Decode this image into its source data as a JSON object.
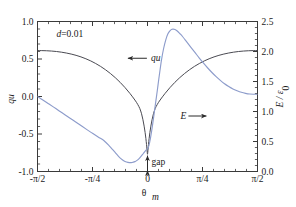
{
  "chart_data": {
    "type": "line",
    "title": "",
    "xlabel": "θ",
    "xlabel_sub": "m",
    "ylabel_left": "qu",
    "ylabel_right": "E / ε",
    "ylabel_right_sub": "0",
    "xlim": [
      -1.5707963,
      1.5707963
    ],
    "ylim_left": [
      -1.0,
      1.0
    ],
    "ylim_right": [
      0.0,
      2.5
    ],
    "grid": false,
    "legend_position": "inline-annotations",
    "xticklabels": [
      "-π/2",
      "-π/4",
      "0",
      "π/4",
      "π/2"
    ],
    "xtickvalues": [
      -1.5707963,
      -0.7853982,
      0,
      0.7853982,
      1.5707963
    ],
    "yticklabels_left": [
      "1.0",
      "0.5",
      "0.0",
      "-0.5",
      "-1.0"
    ],
    "ytickvalues_left": [
      1.0,
      0.5,
      0.0,
      -0.5,
      -1.0
    ],
    "yticklabels_right": [
      "2.5",
      "2.0",
      "1.5",
      "1.0",
      "0.5",
      "0.0"
    ],
    "ytickvalues_right": [
      2.5,
      2.0,
      1.5,
      1.0,
      0.5,
      0.0
    ],
    "minor_ticks_per_interval": 5,
    "annotations": [
      {
        "id": "param",
        "text": "d=0.01",
        "x": -1.3,
        "y_left": 0.8
      },
      {
        "id": "qu-label",
        "text": "qu",
        "arrow": "left",
        "x": 0.02,
        "y_left": 0.47
      },
      {
        "id": "E-label",
        "text": "E",
        "arrow": "right",
        "x": 0.47,
        "y_left": -0.3
      },
      {
        "id": "gap-label",
        "text": "gap",
        "arrow": "vertical-double",
        "x": 0.0,
        "y_left": -0.88
      }
    ],
    "series": [
      {
        "name": "qu",
        "axis": "left",
        "color": "#4a4a52",
        "points": [
          [
            -1.5708,
            0.612
          ],
          [
            -1.51,
            0.612
          ],
          [
            -1.44,
            0.61
          ],
          [
            -1.37,
            0.606
          ],
          [
            -1.3,
            0.6
          ],
          [
            -1.23,
            0.591
          ],
          [
            -1.16,
            0.58
          ],
          [
            -1.09,
            0.566
          ],
          [
            -1.02,
            0.549
          ],
          [
            -0.95,
            0.528
          ],
          [
            -0.88,
            0.503
          ],
          [
            -0.81,
            0.474
          ],
          [
            -0.74,
            0.44
          ],
          [
            -0.67,
            0.401
          ],
          [
            -0.6,
            0.357
          ],
          [
            -0.53,
            0.307
          ],
          [
            -0.46,
            0.251
          ],
          [
            -0.39,
            0.188
          ],
          [
            -0.32,
            0.118
          ],
          [
            -0.25,
            0.04
          ],
          [
            -0.18,
            -0.047
          ],
          [
            -0.14,
            -0.105
          ],
          [
            -0.11,
            -0.16
          ],
          [
            -0.085,
            -0.23
          ],
          [
            -0.065,
            -0.31
          ],
          [
            -0.048,
            -0.395
          ],
          [
            -0.034,
            -0.48
          ],
          [
            -0.023,
            -0.56
          ],
          [
            -0.014,
            -0.64
          ],
          [
            -0.008,
            -0.7
          ],
          [
            -0.0035,
            -0.745
          ],
          [
            0.0,
            -0.77
          ],
          [
            0.0035,
            -0.745
          ],
          [
            0.008,
            -0.7
          ],
          [
            0.014,
            -0.64
          ],
          [
            0.023,
            -0.56
          ],
          [
            0.034,
            -0.48
          ],
          [
            0.048,
            -0.395
          ],
          [
            0.065,
            -0.31
          ],
          [
            0.085,
            -0.23
          ],
          [
            0.11,
            -0.16
          ],
          [
            0.14,
            -0.105
          ],
          [
            0.18,
            -0.047
          ],
          [
            0.25,
            0.04
          ],
          [
            0.32,
            0.118
          ],
          [
            0.39,
            0.188
          ],
          [
            0.46,
            0.251
          ],
          [
            0.53,
            0.307
          ],
          [
            0.6,
            0.357
          ],
          [
            0.67,
            0.401
          ],
          [
            0.74,
            0.44
          ],
          [
            0.81,
            0.474
          ],
          [
            0.88,
            0.503
          ],
          [
            0.95,
            0.528
          ],
          [
            1.02,
            0.549
          ],
          [
            1.09,
            0.566
          ],
          [
            1.16,
            0.58
          ],
          [
            1.23,
            0.591
          ],
          [
            1.3,
            0.6
          ],
          [
            1.37,
            0.606
          ],
          [
            1.44,
            0.61
          ],
          [
            1.51,
            0.612
          ],
          [
            1.5708,
            0.612
          ]
        ]
      },
      {
        "name": "E",
        "axis": "right",
        "color": "#8d9ccb",
        "points": [
          [
            -1.5708,
            1.25
          ],
          [
            -1.5,
            1.196
          ],
          [
            -1.42,
            1.135
          ],
          [
            -1.34,
            1.073
          ],
          [
            -1.26,
            1.01
          ],
          [
            -1.18,
            0.947
          ],
          [
            -1.1,
            0.884
          ],
          [
            -1.02,
            0.821
          ],
          [
            -0.94,
            0.757
          ],
          [
            -0.86,
            0.694
          ],
          [
            -0.78,
            0.632
          ],
          [
            -0.7,
            0.572
          ],
          [
            -0.62,
            0.513
          ],
          [
            -0.54,
            0.42
          ],
          [
            -0.5,
            0.368
          ],
          [
            -0.46,
            0.315
          ],
          [
            -0.42,
            0.262
          ],
          [
            -0.38,
            0.215
          ],
          [
            -0.34,
            0.18
          ],
          [
            -0.3,
            0.158
          ],
          [
            -0.26,
            0.148
          ],
          [
            -0.22,
            0.15
          ],
          [
            -0.18,
            0.165
          ],
          [
            -0.15,
            0.185
          ],
          [
            -0.12,
            0.215
          ],
          [
            -0.09,
            0.255
          ],
          [
            -0.06,
            0.3
          ],
          [
            -0.03,
            0.345
          ],
          [
            0.0,
            0.38
          ],
          [
            0.02,
            0.43
          ],
          [
            0.04,
            0.54
          ],
          [
            0.06,
            0.68
          ],
          [
            0.08,
            0.84
          ],
          [
            0.1,
            1.01
          ],
          [
            0.12,
            1.18
          ],
          [
            0.14,
            1.35
          ],
          [
            0.16,
            1.53
          ],
          [
            0.18,
            1.7
          ],
          [
            0.2,
            1.86
          ],
          [
            0.23,
            2.05
          ],
          [
            0.26,
            2.19
          ],
          [
            0.29,
            2.29
          ],
          [
            0.32,
            2.345
          ],
          [
            0.35,
            2.37
          ],
          [
            0.38,
            2.37
          ],
          [
            0.42,
            2.345
          ],
          [
            0.46,
            2.3
          ],
          [
            0.5,
            2.25
          ],
          [
            0.56,
            2.16
          ],
          [
            0.62,
            2.07
          ],
          [
            0.68,
            1.98
          ],
          [
            0.74,
            1.89
          ],
          [
            0.8,
            1.805
          ],
          [
            0.86,
            1.725
          ],
          [
            0.92,
            1.65
          ],
          [
            0.98,
            1.58
          ],
          [
            1.04,
            1.518
          ],
          [
            1.1,
            1.462
          ],
          [
            1.16,
            1.415
          ],
          [
            1.22,
            1.375
          ],
          [
            1.28,
            1.345
          ],
          [
            1.34,
            1.32
          ],
          [
            1.4,
            1.303
          ],
          [
            1.46,
            1.292
          ],
          [
            1.52,
            1.288
          ],
          [
            1.5708,
            1.287
          ]
        ]
      }
    ]
  }
}
